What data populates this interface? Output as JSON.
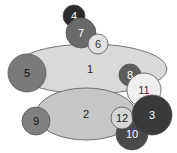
{
  "diagram": {
    "type": "overlapping-ellipses",
    "shapes": [
      {
        "id": "1",
        "label": "1",
        "kind": "ellipse",
        "cx": 90,
        "cy": 69,
        "rx": 77,
        "ry": 25,
        "fill": "#d9d9d9",
        "text": "#222222"
      },
      {
        "id": "2",
        "label": "2",
        "kind": "ellipse",
        "cx": 86,
        "cy": 114,
        "rx": 50,
        "ry": 26,
        "fill": "#c6c6c6",
        "text": "#222222"
      },
      {
        "id": "5",
        "label": "5",
        "kind": "circle",
        "cx": 27,
        "cy": 73,
        "r": 19,
        "fill": "#7a7a7a",
        "text": "#111111"
      },
      {
        "id": "4",
        "label": "4",
        "kind": "circle",
        "cx": 74,
        "cy": 16,
        "r": 11,
        "fill": "#2b2b2b",
        "text": "#ffffff"
      },
      {
        "id": "7",
        "label": "7",
        "kind": "circle",
        "cx": 81,
        "cy": 33,
        "r": 15,
        "fill": "#6a6a6a",
        "text": "#ffffff"
      },
      {
        "id": "6",
        "label": "6",
        "kind": "circle",
        "cx": 98,
        "cy": 44,
        "r": 10,
        "fill": "#e2e2e2",
        "text": "#333333"
      },
      {
        "id": "8",
        "label": "8",
        "kind": "circle",
        "cx": 130,
        "cy": 75,
        "r": 11,
        "fill": "#5e5e5e",
        "text": "#ffffff"
      },
      {
        "id": "9",
        "label": "9",
        "kind": "circle",
        "cx": 36,
        "cy": 121,
        "r": 14,
        "fill": "#808080",
        "text": "#111111"
      },
      {
        "id": "11",
        "label": "11",
        "kind": "circle",
        "cx": 144,
        "cy": 90,
        "r": 17,
        "fill": "#efefef",
        "text": "#333333"
      },
      {
        "id": "10",
        "label": "10",
        "kind": "circle",
        "cx": 132,
        "cy": 134,
        "r": 16,
        "fill": "#4a4a4a",
        "text": "#ffffff"
      },
      {
        "id": "12",
        "label": "12",
        "kind": "circle",
        "cx": 122,
        "cy": 118,
        "r": 11,
        "fill": "#d6d6d6",
        "text": "#222222"
      },
      {
        "id": "3",
        "label": "3",
        "kind": "circle",
        "cx": 152,
        "cy": 115,
        "r": 20,
        "fill": "#3a3a3a",
        "text": "#ffffff"
      }
    ],
    "stroke": "#555555"
  }
}
